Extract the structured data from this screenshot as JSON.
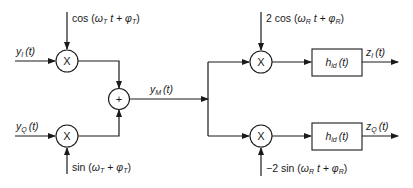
{
  "diagram": {
    "inputs": {
      "in_phase": {
        "base": "y",
        "sub": "I",
        "arg": "(t)"
      },
      "quadrature": {
        "base": "y",
        "sub": "Q",
        "arg": "(t)"
      }
    },
    "carriers": {
      "tx_cos": {
        "prefix": "cos (",
        "w": "ω",
        "w_sub": "T",
        "mid": " t + ",
        "p": "φ",
        "p_sub": "T",
        "suffix": ")"
      },
      "tx_sin": {
        "prefix": "sin (",
        "w": "ω",
        "w_sub": "T",
        "mid": " + ",
        "p": "φ",
        "p_sub": "T",
        "suffix": ")"
      },
      "rx_cos": {
        "prefix": "2 cos (",
        "w": "ω",
        "w_sub": "R",
        "mid": " t + ",
        "p": "φ",
        "p_sub": "R",
        "suffix": ")"
      },
      "rx_sin": {
        "prefix": "−2 sin (",
        "w": "ω",
        "w_sub": "R",
        "mid": " t + ",
        "p": "φ",
        "p_sub": "R",
        "suffix": ")"
      }
    },
    "multiplier_symbol": "X",
    "adder_symbol": "+",
    "modulated": {
      "base": "y",
      "sub": "M",
      "arg": "(t)"
    },
    "filters": {
      "top": {
        "base": "h",
        "sub": "id",
        "arg": "(t)"
      },
      "bottom": {
        "base": "h",
        "sub": "id",
        "arg": "(t)"
      }
    },
    "outputs": {
      "in_phase": {
        "base": "z",
        "sub": "I",
        "arg": "(t)"
      },
      "quadrature": {
        "base": "z",
        "sub": "Q",
        "arg": "(t)"
      }
    },
    "colors": {
      "line": "#1a1a1a",
      "background": "#ffffff"
    }
  }
}
